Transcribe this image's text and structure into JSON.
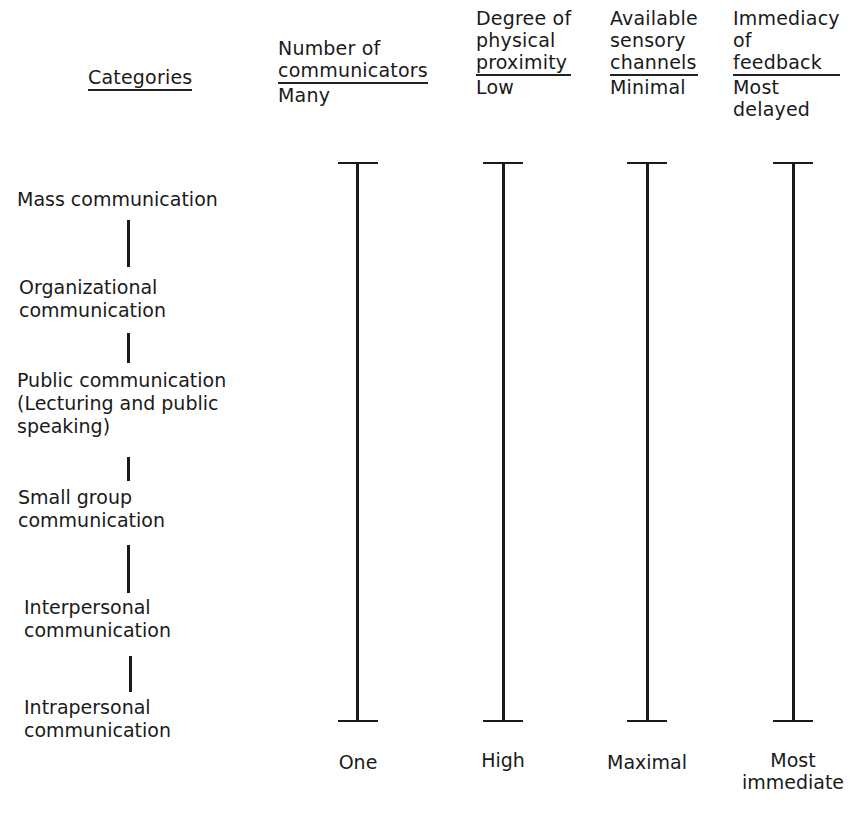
{
  "header": {
    "categories_label": "Categories",
    "columns": [
      {
        "title_lines": [
          "Number of",
          "communicators"
        ],
        "top_value": "Many",
        "top_value_lines": [
          "Many"
        ],
        "bottom_value_lines": [
          "One"
        ]
      },
      {
        "title_lines": [
          "Degree of",
          "physical",
          "proximity"
        ],
        "top_value": "Low",
        "top_value_lines": [
          "Low"
        ],
        "bottom_value_lines": [
          "High"
        ]
      },
      {
        "title_lines": [
          "Available",
          "sensory",
          "channels"
        ],
        "top_value": "Minimal",
        "top_value_lines": [
          "Minimal"
        ],
        "bottom_value_lines": [
          "Maximal"
        ]
      },
      {
        "title_lines": [
          "Immediacy",
          "of",
          "feedback"
        ],
        "top_value": "Most delayed",
        "top_value_lines": [
          "Most",
          "delayed"
        ],
        "bottom_value_lines": [
          "Most",
          "immediate"
        ]
      }
    ]
  },
  "categories": [
    {
      "lines": [
        "Mass communication"
      ]
    },
    {
      "lines": [
        "Organizational",
        "communication"
      ]
    },
    {
      "lines": [
        "Public communication",
        "(Lecturing and public",
        "speaking)"
      ]
    },
    {
      "lines": [
        "Small group",
        "communication"
      ]
    },
    {
      "lines": [
        "Interpersonal",
        "communication"
      ]
    },
    {
      "lines": [
        "Intrapersonal",
        "communication"
      ]
    }
  ],
  "colors": {
    "ink": "#1a1a1a",
    "background": "#ffffff"
  }
}
